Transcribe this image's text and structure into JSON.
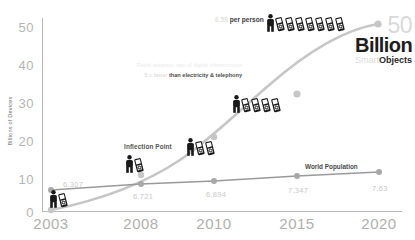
{
  "chart_data": {
    "type": "line",
    "title": "",
    "xlabel": "",
    "ylabel": "Billions of Devices",
    "ylim": [
      0,
      50
    ],
    "yticks": [
      "0",
      "10",
      "20",
      "30",
      "40",
      "50"
    ],
    "categories": [
      "2003",
      "2008",
      "2010",
      "2015",
      "2020"
    ],
    "grid": false,
    "legend_position": "inline-annotations",
    "series": [
      {
        "name": "Connected Devices",
        "color": "#c6c6c6",
        "values": [
          0.5,
          6.8,
          12.5,
          25.0,
          50.0
        ]
      },
      {
        "name": "World Population",
        "color": "#9a9a9a",
        "values": [
          6.307,
          6.721,
          6.894,
          7.347,
          7.63
        ],
        "point_labels": [
          "6.307",
          "6.721",
          "6.894",
          "7.347",
          "7.63"
        ]
      }
    ],
    "annotations": [
      "Inflection Point",
      "World Population",
      "per person",
      "faster than electricity & telephony",
      "50 Billion Objects"
    ]
  },
  "axes": {
    "y_title": "Billions of Devices",
    "y_ticks": [
      "50",
      "40",
      "30",
      "20",
      "10",
      "0"
    ],
    "x_ticks": [
      "2003",
      "2008",
      "2010",
      "2015",
      "2020"
    ]
  },
  "population_labels": [
    "6.307",
    "6.721",
    "6.894",
    "7.347",
    "7.63"
  ],
  "annotations": {
    "inflection_point": "Inflection Point",
    "world_population": "World Population",
    "per_person_value": "6.58",
    "per_person_suffix": "per person",
    "growth_note_line1": "Rapid adoption rate of digital infrastructure",
    "growth_note_line2_faint": "5 x faster",
    "growth_note_line2_strong": "than electricity & telephony"
  },
  "callout": {
    "number": "50",
    "unit": "Billion",
    "objects_dim": "Smart",
    "objects": "Objects"
  },
  "icon_groups": [
    {
      "name": "group-2003",
      "people": 1,
      "phones": 1
    },
    {
      "name": "group-2008",
      "people": 1,
      "phones": 1
    },
    {
      "name": "group-2009",
      "people": 1,
      "phones": 2
    },
    {
      "name": "group-2010",
      "people": 1,
      "phones": 4
    },
    {
      "name": "group-2015",
      "people": 1,
      "phones": 7
    }
  ],
  "colors": {
    "device_curve": "#c6c6c6",
    "population_line": "#9a9a9a",
    "tick_text": "#b5b5b5",
    "icon": "#1a1a1a"
  }
}
